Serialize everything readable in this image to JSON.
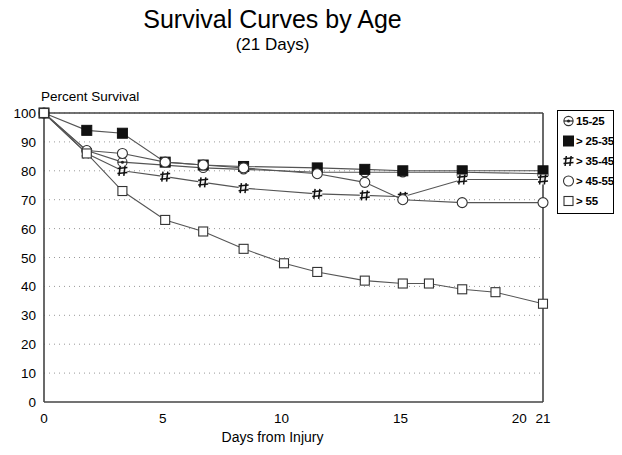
{
  "chart_data": {
    "type": "line",
    "title": "Survival Curves by Age",
    "subtitle": "(21 Days)",
    "xlabel": "Days  from Injury",
    "ylabel": "Percent Survival",
    "xlim": [
      0,
      21
    ],
    "ylim": [
      0,
      100
    ],
    "xticks": [
      0,
      5,
      10,
      15,
      20,
      21
    ],
    "yticks": [
      0,
      10,
      20,
      30,
      40,
      50,
      60,
      70,
      80,
      90,
      100
    ],
    "grid": true,
    "legend_position": "right",
    "series": [
      {
        "name": "15-25",
        "marker": "circle-dot",
        "x": [
          0,
          1.8,
          3.3,
          6.7,
          8.4,
          11.5,
          13.5,
          15.1,
          17.6,
          21
        ],
        "y": [
          100,
          87,
          83,
          81,
          80.5,
          79.5,
          79.5,
          79.5,
          79.5,
          79
        ]
      },
      {
        "name": "> 25-35",
        "marker": "filled-square",
        "x": [
          0,
          1.8,
          3.3,
          5.1,
          6.7,
          8.4,
          11.5,
          13.5,
          15.1,
          17.6,
          21
        ],
        "y": [
          100,
          94,
          93,
          83,
          82,
          81.5,
          81,
          80.5,
          80,
          80,
          80
        ]
      },
      {
        "name": "> 35-45",
        "marker": "hash",
        "x": [
          0,
          1.8,
          3.3,
          5.1,
          6.7,
          8.4,
          11.5,
          13.5,
          15.1,
          17.6,
          21
        ],
        "y": [
          100,
          86,
          80,
          78,
          76,
          74,
          72,
          71.5,
          71,
          77,
          77
        ]
      },
      {
        "name": "> 45-55",
        "marker": "open-circle",
        "x": [
          0,
          1.8,
          3.3,
          5.1,
          6.7,
          8.4,
          11.5,
          13.5,
          15.1,
          17.6,
          21
        ],
        "y": [
          100,
          87,
          86,
          83,
          82,
          81,
          79,
          76,
          70,
          69,
          69
        ]
      },
      {
        "name": "> 55",
        "marker": "open-square",
        "x": [
          0,
          1.8,
          3.3,
          5.1,
          6.7,
          8.4,
          10.1,
          11.5,
          13.5,
          15.1,
          16.2,
          17.6,
          19,
          21
        ],
        "y": [
          100,
          86,
          73,
          63,
          59,
          53,
          48,
          45,
          42,
          41,
          41,
          39,
          38,
          34
        ]
      }
    ]
  },
  "legend": {
    "items": [
      {
        "label": "15-25",
        "marker": "circle-dot"
      },
      {
        "label": "> 25-35",
        "marker": "filled-square"
      },
      {
        "label": "> 35-45",
        "marker": "hash"
      },
      {
        "label": "> 45-55",
        "marker": "open-circle"
      },
      {
        "label": "> 55",
        "marker": "open-square"
      }
    ]
  }
}
